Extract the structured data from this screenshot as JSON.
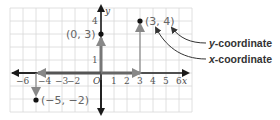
{
  "graph": {
    "x_axis_label": "x",
    "y_axis_label": "y",
    "origin_label": "O",
    "x_ticks": [
      "−6",
      "−4",
      "−3",
      "−2",
      "1",
      "2",
      "3",
      "4",
      "5",
      "6"
    ],
    "y_ticks": [
      "4",
      "1"
    ],
    "points": [
      {
        "label": "(0, 3)",
        "x": 0,
        "y": 3
      },
      {
        "label": "(3, 4)",
        "x": 3,
        "y": 4
      },
      {
        "label": "(−5, −2)",
        "x": -5,
        "y": -2
      }
    ]
  },
  "annotations": {
    "y_coordinate": {
      "var": "y",
      "text": "-coordinate"
    },
    "x_coordinate": {
      "var": "x",
      "text": "-coordinate"
    }
  },
  "colors": {
    "grid": "#d8d8d8",
    "axis": "#1a1a1a",
    "arrow_gray": "#888888",
    "point": "#111111"
  }
}
